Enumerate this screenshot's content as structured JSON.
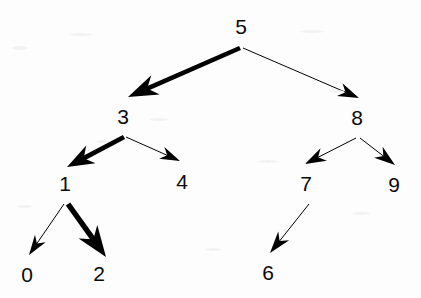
{
  "diagram": {
    "background_color": "#fdfdfd",
    "stroke_color": "#000000",
    "label_color": "#0a0a0a",
    "width": 421,
    "height": 298,
    "nodes": [
      {
        "id": "n5",
        "label": "5",
        "x": 241,
        "y": 26,
        "branch_x": 241,
        "branch_y": 47
      },
      {
        "id": "n3",
        "label": "3",
        "x": 123,
        "y": 116,
        "branch_x": 123,
        "branch_y": 136
      },
      {
        "id": "n8",
        "label": "8",
        "x": 357,
        "y": 117,
        "branch_x": 358,
        "branch_y": 137
      },
      {
        "id": "n1",
        "label": "1",
        "x": 65,
        "y": 183,
        "branch_x": 66,
        "branch_y": 203
      },
      {
        "id": "n4",
        "label": "4",
        "x": 182,
        "y": 181,
        "branch_x": 182,
        "branch_y": 200
      },
      {
        "id": "n7",
        "label": "7",
        "x": 306,
        "y": 183,
        "branch_x": 307,
        "branch_y": 203
      },
      {
        "id": "n9",
        "label": "9",
        "x": 394,
        "y": 184,
        "branch_x": 394,
        "branch_y": 203
      },
      {
        "id": "n0",
        "label": "0",
        "x": 27,
        "y": 274,
        "branch_x": 27,
        "branch_y": 293
      },
      {
        "id": "n2",
        "label": "2",
        "x": 99,
        "y": 273,
        "branch_x": 99,
        "branch_y": 292
      },
      {
        "id": "n6",
        "label": "6",
        "x": 268,
        "y": 272,
        "branch_x": 268,
        "branch_y": 291
      }
    ],
    "edges": [
      {
        "id": "e5-3",
        "from": "5",
        "to": "3",
        "x1": 240,
        "y1": 48,
        "x2": 128,
        "y2": 97,
        "weight": "thick",
        "stroke_width": 4.6,
        "head_length": 30,
        "head_width": 21
      },
      {
        "id": "e5-8",
        "from": "5",
        "to": "8",
        "x1": 243,
        "y1": 48,
        "x2": 359,
        "y2": 98,
        "weight": "thin",
        "stroke_width": 1.0,
        "head_length": 21,
        "head_width": 14
      },
      {
        "id": "e3-1",
        "from": "3",
        "to": "1",
        "x1": 124,
        "y1": 137,
        "x2": 67,
        "y2": 167,
        "weight": "thick",
        "stroke_width": 4.8,
        "head_length": 27,
        "head_width": 20
      },
      {
        "id": "e3-4",
        "from": "3",
        "to": "4",
        "x1": 126,
        "y1": 137,
        "x2": 180,
        "y2": 161,
        "weight": "thin",
        "stroke_width": 1.0,
        "head_length": 20,
        "head_width": 13
      },
      {
        "id": "e1-0",
        "from": "1",
        "to": "0",
        "x1": 64,
        "y1": 204,
        "x2": 29,
        "y2": 255,
        "weight": "thin",
        "stroke_width": 1.0,
        "head_length": 20,
        "head_width": 13
      },
      {
        "id": "e1-2",
        "from": "1",
        "to": "2",
        "x1": 68,
        "y1": 204,
        "x2": 106,
        "y2": 257,
        "weight": "thick",
        "stroke_width": 5.4,
        "head_length": 31,
        "head_width": 23
      },
      {
        "id": "e8-7",
        "from": "8",
        "to": "7",
        "x1": 356,
        "y1": 138,
        "x2": 305,
        "y2": 164,
        "weight": "thin",
        "stroke_width": 1.0,
        "head_length": 21,
        "head_width": 14
      },
      {
        "id": "e8-9",
        "from": "8",
        "to": "9",
        "x1": 360,
        "y1": 138,
        "x2": 395,
        "y2": 165,
        "weight": "thin",
        "stroke_width": 1.0,
        "head_length": 21,
        "head_width": 14
      },
      {
        "id": "e7-6",
        "from": "7",
        "to": "6",
        "x1": 309,
        "y1": 204,
        "x2": 270,
        "y2": 253,
        "weight": "thin",
        "stroke_width": 1.0,
        "head_length": 22,
        "head_width": 14
      }
    ]
  },
  "chart_data": {
    "type": "diagram",
    "subtype": "directed-tree",
    "node_labels": [
      "5",
      "3",
      "8",
      "1",
      "4",
      "7",
      "9",
      "0",
      "2",
      "6"
    ],
    "root": "5",
    "adjacency": [
      {
        "parent": "5",
        "children": [
          "3",
          "8"
        ]
      },
      {
        "parent": "3",
        "children": [
          "1",
          "4"
        ]
      },
      {
        "parent": "8",
        "children": [
          "7",
          "9"
        ]
      },
      {
        "parent": "1",
        "children": [
          "0",
          "2"
        ]
      },
      {
        "parent": "7",
        "children": [
          "6"
        ]
      },
      {
        "parent": "4",
        "children": []
      },
      {
        "parent": "9",
        "children": []
      },
      {
        "parent": "0",
        "children": []
      },
      {
        "parent": "2",
        "children": []
      },
      {
        "parent": "6",
        "children": []
      }
    ],
    "edge_list": [
      {
        "from": "5",
        "to": "3",
        "weight": "thick"
      },
      {
        "from": "5",
        "to": "8",
        "weight": "thin"
      },
      {
        "from": "3",
        "to": "1",
        "weight": "thick"
      },
      {
        "from": "3",
        "to": "4",
        "weight": "thin"
      },
      {
        "from": "1",
        "to": "0",
        "weight": "thin"
      },
      {
        "from": "1",
        "to": "2",
        "weight": "thick"
      },
      {
        "from": "8",
        "to": "7",
        "weight": "thin"
      },
      {
        "from": "8",
        "to": "9",
        "weight": "thin"
      },
      {
        "from": "7",
        "to": "6",
        "weight": "thin"
      }
    ],
    "highlighted_path": [
      "5",
      "3",
      "1",
      "2"
    ],
    "levels": [
      [
        "5"
      ],
      [
        "3",
        "8"
      ],
      [
        "1",
        "4",
        "7",
        "9"
      ],
      [
        "0",
        "2",
        "6"
      ]
    ],
    "grid": false,
    "legend": null
  }
}
